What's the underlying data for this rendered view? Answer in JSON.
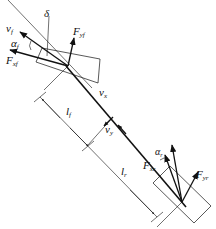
{
  "diagram": {
    "type": "vehicle bicycle model",
    "labels": {
      "v_f": "v",
      "v_f_sub": "f",
      "delta": "δ",
      "alpha_f": "α",
      "alpha_f_sub": "f",
      "F_yf": "F",
      "F_yf_sub": "yf",
      "F_xf": "F",
      "F_xf_sub": "xf",
      "v_x": "v",
      "v_x_sub": "x",
      "v_y": "v",
      "v_y_sub": "y",
      "l_f": "l",
      "l_f_sub": "f",
      "l_r": "l",
      "l_r_sub": "r",
      "alpha_r": "α",
      "alpha_r_sub": "r",
      "F_xr": "F",
      "F_xr_sub": "xr",
      "F_yr": "F",
      "F_yr_sub": "yr"
    },
    "colors": {
      "stroke": "#111111",
      "background": "#ffffff"
    }
  }
}
